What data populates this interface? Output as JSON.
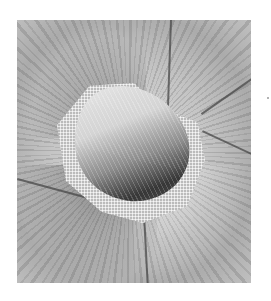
{
  "image": {
    "description": "Grayscale photograph of a stitched embroidery flower with radial long-and-short stitches, a central raised lobe shaded light to dark, surrounded by a mesh/net stitch border",
    "colors": {
      "background": "#ffffff",
      "stitch_light": "#d4d4d4",
      "stitch_mid": "#a9a9a9",
      "shadow": "#3a3a3a"
    }
  }
}
